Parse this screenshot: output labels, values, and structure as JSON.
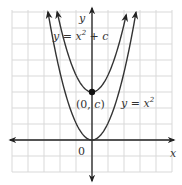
{
  "figure": {
    "x_axis_label": "x",
    "y_axis_label": "y",
    "origin_label": "0",
    "point_label_open": "(0, ",
    "point_label_var": "c",
    "point_label_close": ")",
    "curve_shifted": {
      "prefix": "y = x",
      "exponent": "2",
      "suffix": " + c",
      "vertical_shift_c": 3
    },
    "curve_base": {
      "prefix": "y = x",
      "exponent": "2"
    }
  },
  "chart_data": {
    "type": "line",
    "title": "",
    "xlabel": "x",
    "ylabel": "y",
    "grid": true,
    "xlim": [
      -5,
      5
    ],
    "ylim": [
      -2,
      8
    ],
    "series": [
      {
        "name": "y = x^2",
        "function": "x^2",
        "vertex": [
          0,
          0
        ]
      },
      {
        "name": "y = x^2 + c",
        "function": "x^2 + c",
        "vertex": [
          0,
          3
        ]
      }
    ],
    "annotations": [
      {
        "text": "(0, c)",
        "point": [
          0,
          3
        ]
      },
      {
        "text": "0",
        "point": [
          0,
          0
        ]
      }
    ],
    "colors": {
      "grid": "#d9d9d9",
      "curve": "#333333",
      "axis": "#222222"
    }
  }
}
